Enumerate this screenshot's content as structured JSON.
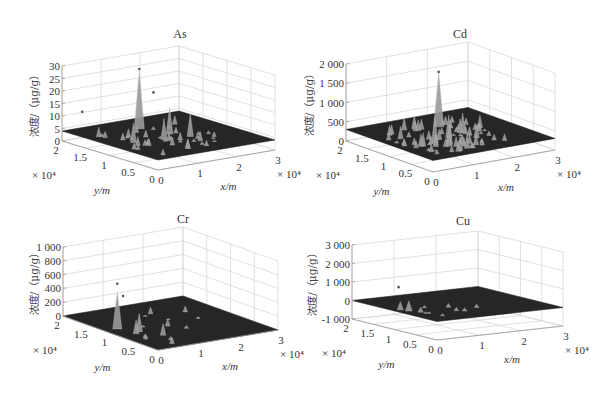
{
  "figure": {
    "width": 604,
    "height": 397,
    "surface_color": "#262626",
    "peak_color": "#9a9a9a",
    "grid_color": "#d4d4d4"
  },
  "chart_data": [
    {
      "type": "surface3d",
      "title": "As",
      "xlabel": "x/m",
      "ylabel": "y/m",
      "zlabel": "浓度/（μg/g）",
      "x_ticks": [
        "0",
        "1",
        "2",
        "3"
      ],
      "y_ticks": [
        "0",
        "0.5",
        "1",
        "1.5",
        "2"
      ],
      "z_ticks": [
        "0",
        "5",
        "10",
        "15",
        "20",
        "25",
        "30"
      ],
      "x_multiplier": "× 10⁴",
      "y_multiplier": "× 10⁴",
      "xlim": [
        0,
        30000
      ],
      "ylim": [
        0,
        20000
      ],
      "zlim": [
        0,
        30
      ],
      "baseline_z": 4,
      "max_peak_z": 27,
      "notes": "Flat dark surface near z≈4 with scattered peaks; tallest ≈27 near back corner"
    },
    {
      "type": "surface3d",
      "title": "Cd",
      "xlabel": "x/m",
      "ylabel": "y/m",
      "zlabel": "浓度/（μg/g）",
      "x_ticks": [
        "0",
        "1",
        "2",
        "3"
      ],
      "y_ticks": [
        "0",
        "0.5",
        "1",
        "1.5",
        "2"
      ],
      "z_ticks": [
        "0",
        "500",
        "1 000",
        "1 500",
        "2 000"
      ],
      "x_multiplier": "× 10⁴",
      "y_multiplier": "× 10⁴",
      "xlim": [
        0,
        30000
      ],
      "ylim": [
        0,
        20000
      ],
      "zlim": [
        0,
        2000
      ],
      "baseline_z": 300,
      "max_peak_z": 1700,
      "notes": "Surface near z≈300 with many peaks; tallest ≈1 700"
    },
    {
      "type": "surface3d",
      "title": "Cr",
      "xlabel": "x/m",
      "ylabel": "y/m",
      "zlabel": "浓度/（μg/g）",
      "x_ticks": [
        "0",
        "1",
        "2",
        "3"
      ],
      "y_ticks": [
        "0",
        "0.5",
        "1",
        "1.5",
        "2"
      ],
      "z_ticks": [
        "0",
        "200",
        "400",
        "600",
        "800",
        "1 000"
      ],
      "x_multiplier": "× 10⁴",
      "y_multiplier": "× 10⁴",
      "xlim": [
        0,
        30000
      ],
      "ylim": [
        0,
        20000
      ],
      "zlim": [
        0,
        1000
      ],
      "baseline_z": 0,
      "max_peak_z": 620,
      "notes": "Surface near z≈0 with few peaks; tallest ≈620"
    },
    {
      "type": "surface3d",
      "title": "Cu",
      "xlabel": "x/m",
      "ylabel": "y/m",
      "zlabel": "浓度/（μg/g）",
      "x_ticks": [
        "0",
        "1",
        "2",
        "3"
      ],
      "y_ticks": [
        "0",
        "0.5",
        "1",
        "1.5",
        "2"
      ],
      "z_ticks": [
        "-1 000",
        "0",
        "1 000",
        "2 000",
        "3 000"
      ],
      "x_multiplier": "× 10⁴",
      "y_multiplier": "× 10⁴",
      "xlim": [
        0,
        30000
      ],
      "ylim": [
        0,
        20000
      ],
      "zlim": [
        -1000,
        3000
      ],
      "baseline_z": 0,
      "max_peak_z": 1100,
      "notes": "Surface near z≈0 with two main peaks ≈1 000"
    }
  ]
}
